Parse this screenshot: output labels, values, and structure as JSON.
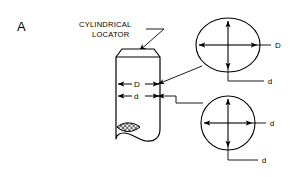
{
  "figure": {
    "panel_letter": "A",
    "callout": {
      "line1": "CYLINDRICAL",
      "line2": "LOCATOR"
    }
  },
  "locator": {
    "dim_major_label": "D",
    "dim_minor_label": "d"
  },
  "sections": [
    {
      "name": "top-section",
      "shape": "ellipse",
      "horizontal_label": "D",
      "vertical_label": "d"
    },
    {
      "name": "bottom-section",
      "shape": "circle",
      "horizontal_label": "d",
      "vertical_label": "d"
    }
  ],
  "colors": {
    "ink": "#000000",
    "background": "#ffffff"
  }
}
